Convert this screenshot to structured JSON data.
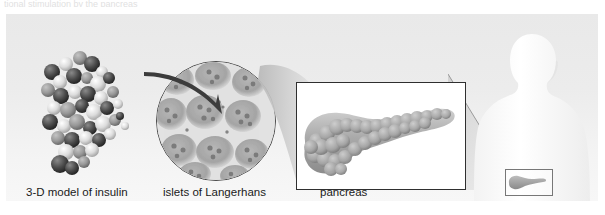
{
  "figure": {
    "top_clipped_text": "tional stimulation by the pancreas",
    "background_color": "#ececec",
    "page_background": "#ffffff"
  },
  "panels": [
    {
      "id": "insulin",
      "caption": "3-D model of insulin",
      "icon": "molecule-spacefill-icon",
      "description": "space-filling 3-D molecular model of insulin"
    },
    {
      "id": "islets",
      "caption": "islets of Langerhans",
      "icon": "micrograph-circle-icon",
      "description": "circular micrograph of pancreatic tissue with arrow"
    },
    {
      "id": "pancreas",
      "caption": "pancreas",
      "icon": "pancreas-organ-icon",
      "description": "whole pancreas organ in white framed box"
    },
    {
      "id": "body",
      "caption": "",
      "icon": "human-torso-silhouette-icon",
      "description": "human torso silhouette with pancreas location inset"
    }
  ],
  "colors": {
    "panel_bg": "#ececec",
    "frame_stroke": "#2f2f2f",
    "arrow": "#3c3c3c",
    "caption_text": "#1a1a1a",
    "molecule_dark": "#3a3a3a",
    "molecule_light": "#e0e0e0",
    "organ_fill": "#b9b9b9",
    "silhouette": "#fdfdfd"
  }
}
